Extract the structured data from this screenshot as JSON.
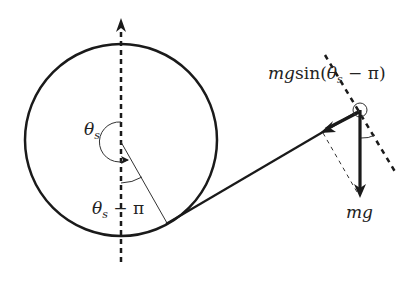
{
  "diagram": {
    "title": "",
    "colors": {
      "stroke": "#1a1a1a",
      "background": "#ffffff",
      "thin": "#333333"
    },
    "labels": {
      "theta_s": {
        "base": "θ",
        "sub": "s"
      },
      "theta_s_minus_pi": {
        "base": "θ",
        "sub": "s",
        "rest": " − π"
      },
      "tangential_force": {
        "prefix": "mg",
        "func": "sin",
        "open": "(",
        "base": "θ",
        "sub": "s",
        "rest": " − π)"
      },
      "weight": "mg"
    },
    "icons": {
      "vertical-axis-arrow": "arrowhead-up",
      "rope-force-arrow": "arrowhead-left",
      "gravity-arrow": "arrowhead-down",
      "angle-arc-arrow": "arrowhead-right"
    }
  }
}
